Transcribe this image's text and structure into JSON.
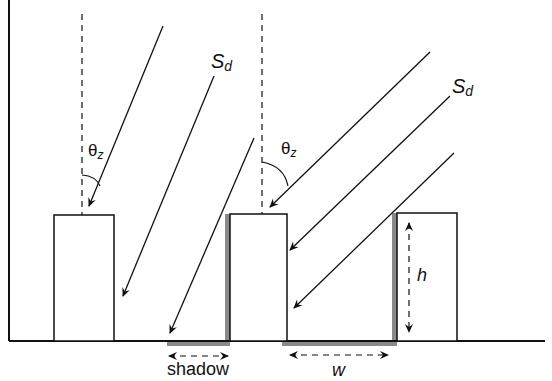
{
  "labels": {
    "sd_left": {
      "main": "S",
      "sub": "d"
    },
    "sd_right": {
      "main": "S",
      "sub": "d"
    },
    "theta_left": {
      "main": "θ",
      "sub": "z"
    },
    "theta_right": {
      "main": "θ",
      "sub": "z"
    },
    "shadow": "shadow",
    "w": "w",
    "h": "h"
  },
  "colors": {
    "line": "#111111",
    "shadow": "#8a8a8a",
    "background": "#ffffff"
  },
  "diagram": {
    "buildings": [
      {
        "x": 54,
        "y": 215,
        "w": 60,
        "h": 126
      },
      {
        "x": 230,
        "y": 214,
        "w": 57,
        "h": 127
      },
      {
        "x": 397,
        "y": 213,
        "w": 60,
        "h": 128
      }
    ],
    "ground_y": 341,
    "zenith_lines": [
      {
        "x": 82,
        "y1": 14,
        "y2": 215
      },
      {
        "x": 262,
        "y1": 14,
        "y2": 214
      }
    ],
    "rays_left": [
      {
        "x1": 163,
        "y1": 26,
        "x2": 89,
        "y2": 206
      },
      {
        "x1": 214,
        "y1": 76,
        "x2": 123,
        "y2": 296
      },
      {
        "x1": 254,
        "y1": 138,
        "x2": 170,
        "y2": 333
      }
    ],
    "rays_right": [
      {
        "x1": 430,
        "y1": 52,
        "x2": 270,
        "y2": 207
      },
      {
        "x1": 450,
        "y1": 96,
        "x2": 290,
        "y2": 250
      },
      {
        "x1": 454,
        "y1": 153,
        "x2": 294,
        "y2": 308
      }
    ]
  }
}
